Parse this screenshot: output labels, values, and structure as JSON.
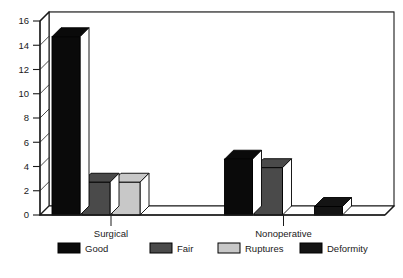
{
  "chart_data": {
    "type": "bar",
    "title": "",
    "subtitle": "",
    "xlabel": "",
    "ylabel": "",
    "categories": [
      "Surgical",
      "Nonoperative"
    ],
    "series": [
      {
        "name": "Good",
        "values": [
          14.7,
          4.6
        ],
        "color": "#0a0a0a"
      },
      {
        "name": "Fair",
        "values": [
          2.7,
          3.9
        ],
        "color": "#4a4a4a"
      },
      {
        "name": "Ruptures",
        "values": [
          2.7,
          0
        ],
        "color": "#c8c8c8"
      },
      {
        "name": "Deformity",
        "values": [
          0,
          0.7
        ],
        "color": "#141414"
      }
    ],
    "ylim": [
      0,
      16
    ],
    "yticks": [
      0,
      2,
      4,
      6,
      8,
      10,
      12,
      14,
      16
    ],
    "ytick_labels": [
      "0",
      "2",
      "4",
      "6",
      "8",
      "10",
      "12",
      "14",
      "16"
    ],
    "grid": true,
    "grid_axis": "y",
    "legend_position": "bottom",
    "style": "3d-bar",
    "axis_color": "#1a1a1a",
    "grid_color": "#8c8c8c",
    "background": "#ffffff"
  }
}
